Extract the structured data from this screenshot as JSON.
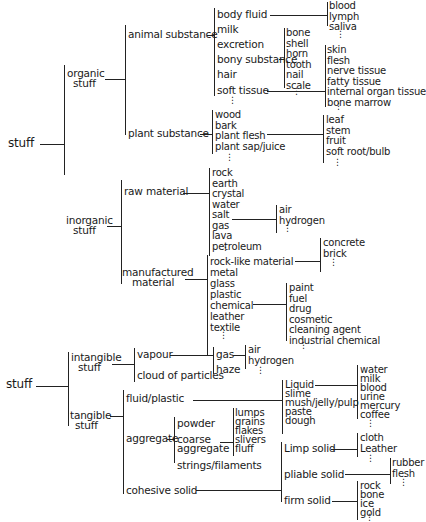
{
  "diagram": {
    "type": "taxonomy-tree",
    "tree1": {
      "root": "stuff",
      "organic": {
        "label_line1": "organic",
        "label_line2": "stuff",
        "animal": {
          "label": "animal substance",
          "items": [
            "body fluid",
            "milk",
            "excretion",
            "bony substance",
            "hair",
            "soft tissue"
          ],
          "body_fluid_children": [
            "blood",
            "lymph",
            "saliva"
          ],
          "bony_children": [
            "bone",
            "shell",
            "horn",
            "tooth",
            "nail",
            "scale"
          ],
          "soft_tissue_children": [
            "skin",
            "flesh",
            "nerve tissue",
            "fatty tissue",
            "internal organ tissue",
            "bone marrow"
          ]
        },
        "plant": {
          "label": "plant substance",
          "items": [
            "wood",
            "bark",
            "plant flesh",
            "plant sap/juice"
          ],
          "plant_flesh_children": [
            "leaf",
            "stem",
            "fruit",
            "soft root/bulb"
          ]
        }
      },
      "inorganic": {
        "label_line1": "inorganic",
        "label_line2": "stuff",
        "raw": {
          "label": "raw material",
          "items": [
            "rock",
            "earth",
            "crystal",
            "water",
            "salt",
            "gas",
            "lava",
            "petroleum"
          ],
          "gas_children": [
            "air",
            "hydrogen"
          ]
        },
        "manufactured": {
          "label_line1": "manufactured",
          "label_line2": "material",
          "items": [
            "rock-like material",
            "metal",
            "glass",
            "plastic",
            "chemical",
            "leather",
            "textile"
          ],
          "rocklike_children": [
            "concrete",
            "brick"
          ],
          "chemical_children": [
            "paint",
            "fuel",
            "drug",
            "cosmetic",
            "cleaning agent",
            "industrial chemical"
          ]
        }
      }
    },
    "tree2": {
      "root": "stuff",
      "intangible": {
        "label_line1": "intangible",
        "label_line2": "stuff",
        "items": [
          "vapour",
          "cloud of particles"
        ],
        "vapour_children": [
          "gas",
          "haze"
        ],
        "gas_children": [
          "air",
          "hydrogen"
        ]
      },
      "tangible": {
        "label_line1": "tangible",
        "label_line2": "stuff",
        "items": [
          "fluid/plastic",
          "aggregate",
          "cohesive solid"
        ],
        "fluid_children": [
          "Liquid",
          "slime",
          "mush/jelly/pulp",
          "paste",
          "dough"
        ],
        "liquid_children": [
          "water",
          "milk",
          "blood",
          "urine",
          "mercury",
          "coffee"
        ],
        "aggregate_children": [
          "powder",
          "coarse aggregate",
          "strings/filaments"
        ],
        "coarse_line1": "coarse",
        "coarse_line2": "aggregate",
        "coarse_children": [
          "lumps",
          "grains",
          "flakes",
          "slivers",
          "fluff"
        ],
        "solid_children": [
          "Limp solid",
          "pliable solid",
          "firm solid"
        ],
        "limp_children": [
          "cloth",
          "Leather"
        ],
        "pliable_children": [
          "rubber",
          "flesh"
        ],
        "firm_children": [
          "rock",
          "bone",
          "ice",
          "gold"
        ]
      }
    },
    "ellipsis": "⋮"
  }
}
